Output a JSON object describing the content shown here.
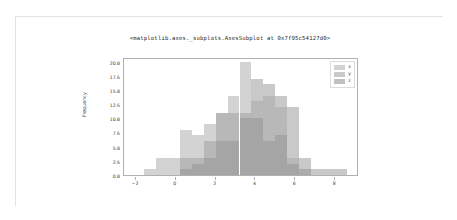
{
  "output": {
    "title": "<matplotlib.axes._subplots.AxesSubplot at 0x7f95c54127d0>"
  },
  "chart_data": {
    "type": "bar",
    "subtype": "histogram-overlaid",
    "title": "<matplotlib.axes._subplots.AxesSubplot at 0x7f95c54127d0>",
    "xlabel": "",
    "ylabel": "Frequency",
    "xlim": [
      -2.6,
      9.2
    ],
    "ylim": [
      0,
      20.8
    ],
    "grid": false,
    "legend_position": "upper right",
    "xticks": [
      -2,
      0,
      2,
      4,
      6,
      8
    ],
    "xtick_labels": [
      "−2",
      "0",
      "2",
      "4",
      "6",
      "8"
    ],
    "yticks": [
      0.0,
      2.5,
      5.0,
      7.5,
      10.0,
      12.5,
      15.0,
      17.5,
      20.0
    ],
    "ytick_labels": [
      "0.0",
      "2.5",
      "5.0",
      "7.5",
      "10.0",
      "12.5",
      "15.0",
      "17.5",
      "20.0"
    ],
    "bin_edges": [
      -1.6,
      -1.0,
      -0.4,
      0.2,
      0.8,
      1.4,
      2.0,
      2.6,
      3.2,
      3.8,
      4.4,
      5.0,
      5.6,
      6.2,
      6.8,
      7.4,
      8.0,
      8.6
    ],
    "series": [
      {
        "name": "x",
        "color": "#b8b8b8",
        "values": [
          1,
          3,
          3,
          8,
          7,
          9,
          11,
          14,
          20,
          13,
          14,
          12,
          3,
          0,
          0,
          0,
          0
        ]
      },
      {
        "name": "y",
        "color": "#a8a8a8",
        "values": [
          0,
          0,
          0,
          3,
          3,
          6,
          11,
          11,
          11,
          17,
          16,
          14,
          12,
          3,
          1,
          1,
          1
        ]
      },
      {
        "name": "z",
        "color": "#9a9a9a",
        "values": [
          0,
          0,
          0,
          1,
          2,
          3,
          6,
          6,
          10,
          10,
          6,
          7,
          2,
          1,
          0,
          0,
          0
        ]
      }
    ],
    "legend_entries": [
      "x",
      "y",
      "z"
    ]
  },
  "colors": {
    "series_x": "#c4c4c4",
    "series_y": "#aeaeae",
    "series_z": "#989898",
    "axis": "#b0b0b0",
    "text": "#3a3a3a",
    "card_border": "#e3e3e3",
    "background": "#ffffff"
  }
}
